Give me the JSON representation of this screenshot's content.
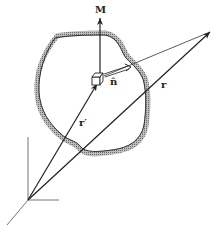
{
  "figure": {
    "type": "physics vector diagram"
  },
  "labels": {
    "magnetization": "M",
    "unit_normal": "n̂",
    "field_point_vector": "r",
    "source_point_vector": "r′"
  },
  "elements": {
    "body_outline": "shaded irregular closed surface",
    "volume_element": "small cube",
    "coordinate_axes": "3D axes at origin"
  },
  "colors": {
    "line": "#222222",
    "shading": "#9a9a9a",
    "axes": "#777777",
    "background": "#ffffff"
  }
}
